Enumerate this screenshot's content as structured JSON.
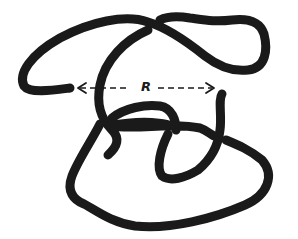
{
  "figure": {
    "label": "R",
    "colors": {
      "stroke": "#1a1a1a",
      "background": "#ffffff"
    }
  }
}
